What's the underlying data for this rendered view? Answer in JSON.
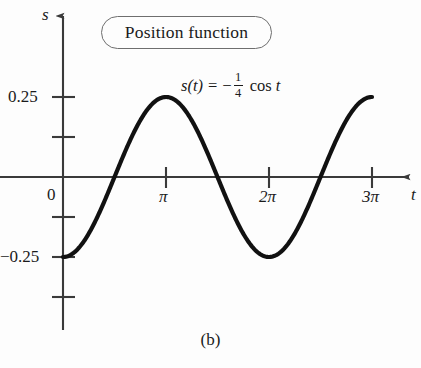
{
  "figure": {
    "caption": "(b)",
    "callout_label": "Position function",
    "background_color": "#fdfdfd",
    "curve_color": "#111111",
    "axis_color": "#3a3a3a"
  },
  "equation": {
    "lhs_function": "s",
    "lhs_variable": "t",
    "lhs": "s(t)",
    "equals": "=",
    "minus": "−",
    "fraction_numerator": "1",
    "fraction_denominator": "4",
    "trig": "cos",
    "argument": "t",
    "full": "s(t) = − 1/4 cos t"
  },
  "axes": {
    "y_label": "s",
    "x_label": "t",
    "origin_label": "0",
    "y_ticks": [
      {
        "value": 0.25,
        "label": "0.25"
      },
      {
        "value": 0.125,
        "label": ""
      },
      {
        "value": -0.125,
        "label": ""
      },
      {
        "value": -0.25,
        "label": "−0.25"
      },
      {
        "value": -0.375,
        "label": ""
      }
    ],
    "x_ticks": [
      {
        "value": 3.14159,
        "label": "π"
      },
      {
        "value": 6.28319,
        "label": "2π"
      },
      {
        "value": 9.42478,
        "label": "3π"
      }
    ]
  },
  "chart_data": {
    "type": "line",
    "title": "Position function",
    "xlabel": "t",
    "ylabel": "s",
    "xlim": [
      -0.6,
      10.4
    ],
    "ylim": [
      -0.5,
      0.46
    ],
    "grid": false,
    "legend": null,
    "annotations": [
      {
        "text": "Position function",
        "kind": "callout-box"
      },
      {
        "text": "s(t) = −(1/4) cos t",
        "kind": "equation"
      },
      {
        "text": "(b)",
        "kind": "caption"
      }
    ],
    "series": [
      {
        "name": "s(t) = -0.25 cos t",
        "formula": "s(t) = -(1/4)*cos(t)",
        "x": [
          0.0,
          0.3927,
          0.7854,
          1.1781,
          1.5708,
          1.9635,
          2.3562,
          2.7489,
          3.1416,
          3.5343,
          3.927,
          4.3197,
          4.7124,
          5.1051,
          5.4978,
          5.8905,
          6.2832,
          6.6759,
          7.0686,
          7.4613,
          7.854,
          8.2467,
          8.6394,
          9.0321,
          9.4248
        ],
        "y": [
          -0.25,
          -0.231,
          -0.1768,
          -0.0957,
          0.0,
          0.0957,
          0.1768,
          0.231,
          0.25,
          0.231,
          0.1768,
          0.0957,
          0.0,
          -0.0957,
          -0.1768,
          -0.231,
          -0.25,
          -0.231,
          -0.1768,
          -0.0957,
          0.0,
          0.0957,
          0.1768,
          0.231,
          0.25
        ]
      }
    ],
    "key_points": {
      "minima_t": [
        0.0,
        6.28319
      ],
      "minima_s": -0.25,
      "maxima_t": [
        3.14159,
        9.42478
      ],
      "maxima_s": 0.25,
      "zeros_t": [
        1.5708,
        4.7124,
        7.854
      ]
    }
  }
}
